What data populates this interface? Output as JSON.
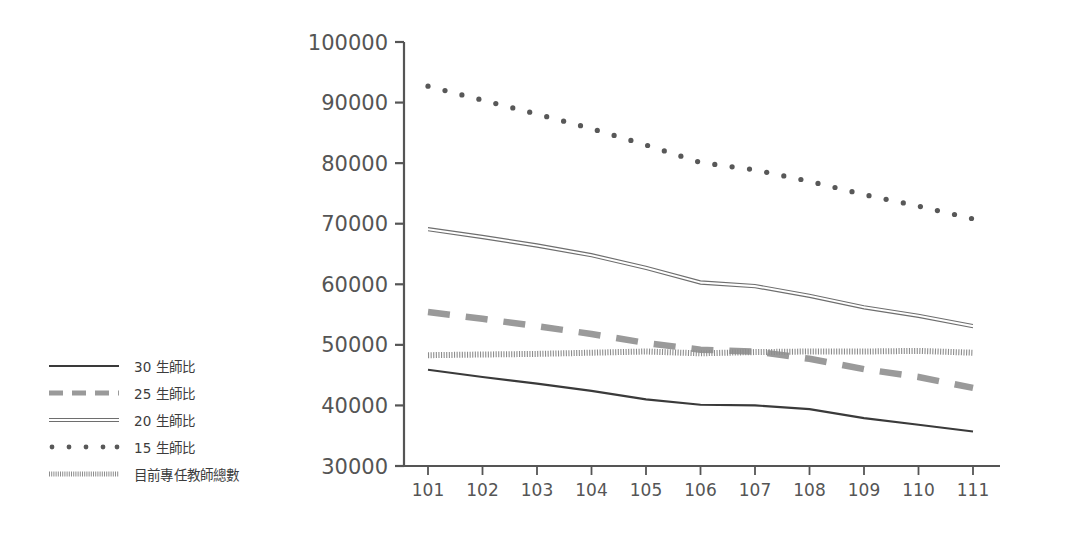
{
  "chart_data": {
    "type": "line",
    "title": "",
    "subtitle": "",
    "xlabel": "",
    "ylabel": "",
    "x": [
      101,
      102,
      103,
      104,
      105,
      106,
      107,
      108,
      109,
      110,
      111
    ],
    "xtick_labels": [
      "101",
      "102",
      "103",
      "104",
      "105",
      "106",
      "107",
      "108",
      "109",
      "110",
      "111"
    ],
    "ytick_labels": [
      "100000",
      "90000",
      "80000",
      "70000",
      "60000",
      "50000",
      "40000",
      "30000"
    ],
    "ytick_values": [
      100000,
      90000,
      80000,
      70000,
      60000,
      50000,
      40000,
      30000
    ],
    "xlim": [
      101,
      111
    ],
    "ylim": [
      30000,
      100000
    ],
    "grid": false,
    "legend_position": "left",
    "series": [
      {
        "name": "30 生師比",
        "style": "solid",
        "color": "#3a3a3a",
        "values": [
          45900,
          44700,
          43600,
          42400,
          41000,
          40100,
          40000,
          39400,
          37900,
          36800,
          35700
        ]
      },
      {
        "name": "25 生師比",
        "style": "dashed",
        "color": "#9a9a9a",
        "values": [
          55400,
          54300,
          53100,
          51800,
          50300,
          49200,
          48900,
          47700,
          46000,
          44700,
          42900
        ]
      },
      {
        "name": "20 生師比",
        "style": "double",
        "color": "#6e6e6e",
        "values": [
          69100,
          67800,
          66400,
          64800,
          62700,
          60300,
          59700,
          58100,
          56200,
          54800,
          53100
        ]
      },
      {
        "name": "15 生師比",
        "style": "dotted-large",
        "color": "#585858",
        "values": [
          92700,
          90400,
          88100,
          85700,
          83000,
          80100,
          78900,
          77000,
          74800,
          72900,
          70800
        ]
      },
      {
        "name": "目前專任教師總數",
        "style": "dotted-fine",
        "color": "#8d8d8d",
        "values": [
          48300,
          48400,
          48500,
          48700,
          48900,
          48600,
          48800,
          48900,
          48900,
          49000,
          48700
        ]
      }
    ]
  },
  "legend": {
    "items": [
      {
        "label": "30 生師比",
        "swatch": "solid-line-swatch"
      },
      {
        "label": "25 生師比",
        "swatch": "dashed-line-swatch"
      },
      {
        "label": "20 生師比",
        "swatch": "double-line-swatch"
      },
      {
        "label": "15 生師比",
        "swatch": "dotted-large-swatch"
      },
      {
        "label": "目前專任教師總數",
        "swatch": "dotted-fine-swatch"
      }
    ]
  },
  "axes": {
    "axis_color": "#555555"
  }
}
